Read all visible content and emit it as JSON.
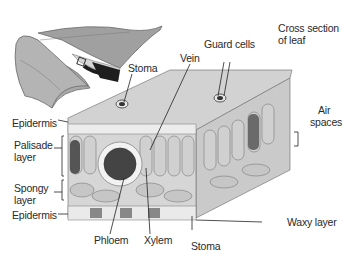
{
  "diagram": {
    "title_line1": "Cross section",
    "title_line2": "of leaf",
    "labels": {
      "stoma_top": "Stoma",
      "vein": "Vein",
      "guard_cells": "Guard cells",
      "air_line1": "Air",
      "air_line2": "spaces",
      "epidermis_top": "Epidermis",
      "palisade_line1": "Palisade",
      "palisade_line2": "layer",
      "spongy_line1": "Spongy",
      "spongy_line2": "layer",
      "epidermis_bottom": "Epidermis",
      "phloem": "Phloem",
      "xylem": "Xylem",
      "stoma_bottom": "Stoma",
      "waxy_layer": "Waxy layer"
    },
    "colors": {
      "cell_fill": "#d8d8d8",
      "cell_stroke": "#7a7a7a",
      "leaf_fill": "#a8a8a8",
      "dark": "#1e1e1e",
      "label_text": "#2a2a2a"
    }
  }
}
